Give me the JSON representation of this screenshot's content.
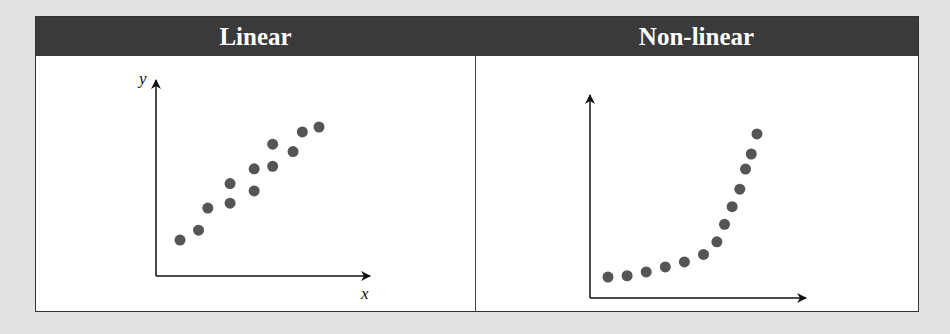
{
  "headers": {
    "linear": "Linear",
    "nonlinear": "Non-linear"
  },
  "axes": {
    "y_label": "y",
    "x_label": "x"
  },
  "colors": {
    "header_bg": "#3a3a3a",
    "dot": "#555555",
    "page_bg": "#e2e2e2"
  },
  "chart_data": [
    {
      "type": "scatter",
      "title": "Linear",
      "xlabel": "x",
      "ylabel": "y",
      "points": [
        [
          1,
          1
        ],
        [
          2,
          1.4
        ],
        [
          2.5,
          2.3
        ],
        [
          3.7,
          2.5
        ],
        [
          3.7,
          3.3
        ],
        [
          5,
          3
        ],
        [
          5,
          3.9
        ],
        [
          6,
          4
        ],
        [
          6,
          4.9
        ],
        [
          7.1,
          4.6
        ],
        [
          7.6,
          5.4
        ],
        [
          8.5,
          5.6
        ]
      ],
      "grid": false
    },
    {
      "type": "scatter",
      "title": "Non-linear",
      "xlabel": "",
      "ylabel": "",
      "points": [
        [
          1,
          1
        ],
        [
          2,
          1.05
        ],
        [
          3,
          1.2
        ],
        [
          4,
          1.4
        ],
        [
          5,
          1.6
        ],
        [
          6,
          1.9
        ],
        [
          6.7,
          2.4
        ],
        [
          7.1,
          3.1
        ],
        [
          7.5,
          3.8
        ],
        [
          7.9,
          4.5
        ],
        [
          8.2,
          5.3
        ],
        [
          8.5,
          5.9
        ],
        [
          8.8,
          6.7
        ]
      ],
      "grid": false
    }
  ]
}
